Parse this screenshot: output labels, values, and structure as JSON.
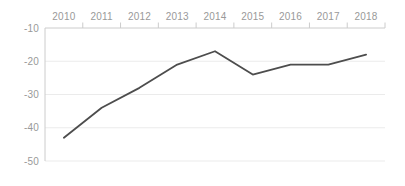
{
  "chart": {
    "background_color": "#ffffff"
  },
  "chart_data": {
    "type": "line",
    "title": "",
    "categories": [
      "2010",
      "2011",
      "2012",
      "2013",
      "2014",
      "2015",
      "2016",
      "2017",
      "2018"
    ],
    "series": [
      {
        "name": "series-1",
        "values": [
          -43,
          -34,
          -28,
          -21,
          -17,
          -24,
          -21,
          -21,
          -18
        ],
        "color": "#4d4d4d",
        "stroke_width": 1.8
      }
    ],
    "xlabel": "",
    "ylabel": "",
    "x_axis_position": "top",
    "ylim": [
      -50,
      -10
    ],
    "yticks": [
      -10,
      -20,
      -30,
      -40,
      -50
    ],
    "ytick_labels": [
      "-10",
      "-20",
      "-30",
      "-40",
      "-50"
    ],
    "grid": "horizontal",
    "legend_position": "none",
    "axis_color": "#cccccc",
    "grid_color": "#ebebeb",
    "tick_label_color": "#999999",
    "tick_label_font_size": 10
  }
}
